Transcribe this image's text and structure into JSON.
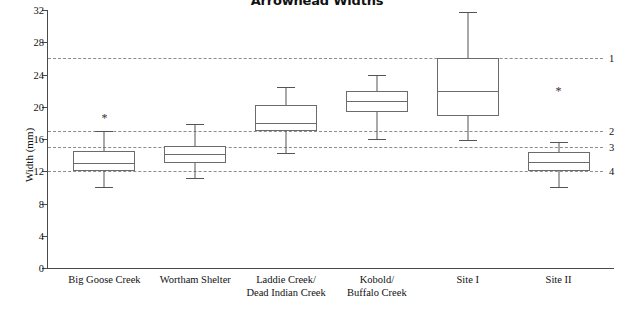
{
  "chart_data": {
    "type": "box",
    "title": "Arrowhead Widths",
    "xlabel": "",
    "ylabel": "Width (mm)",
    "ylim": [
      0,
      32
    ],
    "yticks": [
      0,
      4,
      8,
      12,
      16,
      20,
      24,
      28,
      32
    ],
    "grid": false,
    "legend": "none",
    "categories": [
      "Big Goose Creek",
      "Wortham Shelter",
      "Laddie Creek/\nDead Indian Creek",
      "Kobold/\nBuffalo Creek",
      "Site I",
      "Site II"
    ],
    "boxes": [
      {
        "label_line1": "Big Goose Creek",
        "label_line2": "",
        "whisker_low": 10.0,
        "q1": 12.0,
        "median": 13.0,
        "q3": 14.5,
        "whisker_high": 17.0,
        "outliers": [
          18.6
        ]
      },
      {
        "label_line1": "Wortham Shelter",
        "label_line2": "",
        "whisker_low": 11.2,
        "q1": 13.0,
        "median": 14.1,
        "q3": 15.1,
        "whisker_high": 17.8,
        "outliers": []
      },
      {
        "label_line1": "Laddie Creek/",
        "label_line2": "Dead Indian Creek",
        "whisker_low": 14.3,
        "q1": 17.0,
        "median": 18.0,
        "q3": 20.2,
        "whisker_high": 22.4,
        "outliers": []
      },
      {
        "label_line1": "Kobold/",
        "label_line2": "Buffalo Creek",
        "whisker_low": 16.0,
        "q1": 19.4,
        "median": 20.7,
        "q3": 22.0,
        "whisker_high": 24.0,
        "outliers": []
      },
      {
        "label_line1": "Site I",
        "label_line2": "",
        "whisker_low": 15.9,
        "q1": 18.8,
        "median": 22.0,
        "q3": 26.0,
        "whisker_high": 31.7,
        "outliers": []
      },
      {
        "label_line1": "Site II",
        "label_line2": "",
        "whisker_low": 10.1,
        "q1": 12.0,
        "median": 13.2,
        "q3": 14.4,
        "whisker_high": 15.6,
        "outliers": [
          21.9
        ]
      }
    ],
    "reference_lines": [
      {
        "label": "1",
        "value": 26.0
      },
      {
        "label": "2",
        "value": 17.0
      },
      {
        "label": "3",
        "value": 15.0
      },
      {
        "label": "4",
        "value": 12.0
      }
    ],
    "colors": {
      "axis": "#4a4a4a",
      "box_stroke": "#6b6b6b",
      "whisker": "#555555",
      "reference_line": "#8c8c8c",
      "background": "#ffffff",
      "text": "#111111"
    }
  }
}
